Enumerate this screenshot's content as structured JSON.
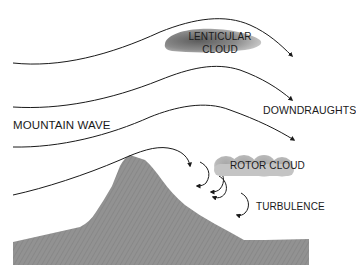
{
  "diagram": {
    "title": "MOUNTAIN WAVE",
    "labels": {
      "lenticular_cloud_line1": "LENTICULAR",
      "lenticular_cloud_line2": "CLOUD",
      "downdraughts": "DOWNDRAUGHTS",
      "mountain_wave": "MOUNTAIN WAVE",
      "rotor_cloud": "ROTOR CLOUD",
      "turbulence": "TURBULENCE"
    },
    "colors": {
      "mountain": "#8f8f8f",
      "lines": "#1a1a1a",
      "cloud_dark": "#6e6e6e",
      "cloud_light": "#d4d4d4",
      "text": "#1a1a1a"
    },
    "elements": [
      {
        "type": "airflow-line",
        "count": 4
      },
      {
        "type": "cloud",
        "name": "lenticular cloud"
      },
      {
        "type": "cloud",
        "name": "rotor cloud"
      },
      {
        "type": "turbulence-eddy",
        "count": 4
      },
      {
        "type": "terrain",
        "name": "mountain"
      }
    ]
  }
}
